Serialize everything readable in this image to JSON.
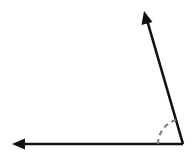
{
  "diagram": {
    "type": "angle",
    "colors": {
      "background": "#ffffff",
      "ray": "#111111",
      "arc": "#777777"
    },
    "vertex": {
      "x": 183,
      "y": 144
    },
    "rays": [
      {
        "name": "horizontal-ray",
        "end": {
          "x": 12,
          "y": 144
        },
        "arrowhead": true
      },
      {
        "name": "slanted-ray",
        "end": {
          "x": 144,
          "y": 11
        },
        "arrowhead": true
      }
    ],
    "arc": {
      "radius": 25,
      "style": "dashed"
    }
  }
}
